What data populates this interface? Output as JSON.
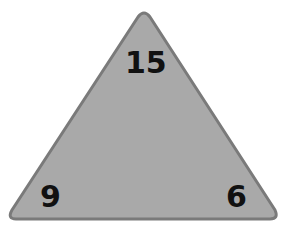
{
  "triangle": {
    "fill": "#a9a9a9",
    "stroke": "#7a7a7a",
    "top": "15",
    "bottom_left": "9",
    "bottom_right": "6"
  }
}
